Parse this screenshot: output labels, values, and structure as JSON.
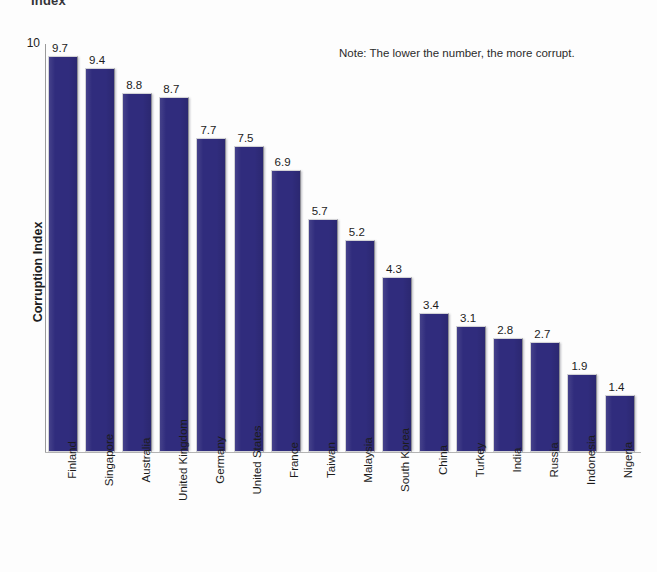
{
  "chart_data": {
    "type": "bar",
    "title": "Index",
    "note": "Note: The lower the number, the more corrupt.",
    "xlabel": "",
    "ylabel": "Corruption Index",
    "ylim": [
      0,
      10
    ],
    "y_ticks": [
      "10"
    ],
    "grid": false,
    "legend": "none",
    "bar_color": "#302c7d",
    "background_color": "#fdfdfd",
    "categories": [
      "Finland",
      "Singapore",
      "Australia",
      "United Kingdom",
      "Germany",
      "United States",
      "France",
      "Taiwan",
      "Malaysia",
      "South Korea",
      "China",
      "Turkey",
      "India",
      "Russia",
      "Indonesia",
      "Nigeria"
    ],
    "values": [
      9.7,
      9.4,
      8.8,
      8.7,
      7.7,
      7.5,
      6.9,
      5.7,
      5.2,
      4.3,
      3.4,
      3.1,
      2.8,
      2.7,
      1.9,
      1.4
    ],
    "value_labels": [
      "9.7",
      "9.4",
      "8.8",
      "8.7",
      "7.7",
      "7.5",
      "6.9",
      "5.7",
      "5.2",
      "4.3",
      "3.4",
      "3.1",
      "2.8",
      "2.7",
      "1.9",
      "1.4"
    ]
  }
}
